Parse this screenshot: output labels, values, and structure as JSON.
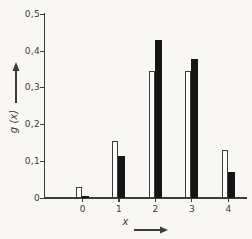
{
  "colors": {
    "background": "#f8f7f3",
    "ink": "#3c3c3c",
    "bar_fill_open": "#fdfdfb",
    "bar_fill_solid": "#151515"
  },
  "icons": {
    "y_axis_arrow": "up-arrow",
    "x_axis_arrow": "right-arrow"
  },
  "chart_data": {
    "type": "bar",
    "title": "",
    "xlabel": "x",
    "ylabel": "g (x)",
    "categories": [
      "0",
      "1",
      "2",
      "3",
      "4"
    ],
    "series": [
      {
        "name": "open-bars",
        "style": "outlined-white",
        "values": [
          0.03,
          0.155,
          0.345,
          0.345,
          0.13
        ]
      },
      {
        "name": "solid-bars",
        "style": "filled-black",
        "values": [
          0.005,
          0.115,
          0.43,
          0.38,
          0.072
        ]
      }
    ],
    "ylim": [
      0,
      0.5
    ],
    "y_ticks": [
      {
        "value": 0.0,
        "label": "0"
      },
      {
        "value": 0.1,
        "label": "0,1"
      },
      {
        "value": 0.2,
        "label": "0,2"
      },
      {
        "value": 0.3,
        "label": "0,3"
      },
      {
        "value": 0.4,
        "label": "0,4"
      },
      {
        "value": 0.5,
        "label": "0,5"
      }
    ],
    "grid": false,
    "legend": "none"
  }
}
